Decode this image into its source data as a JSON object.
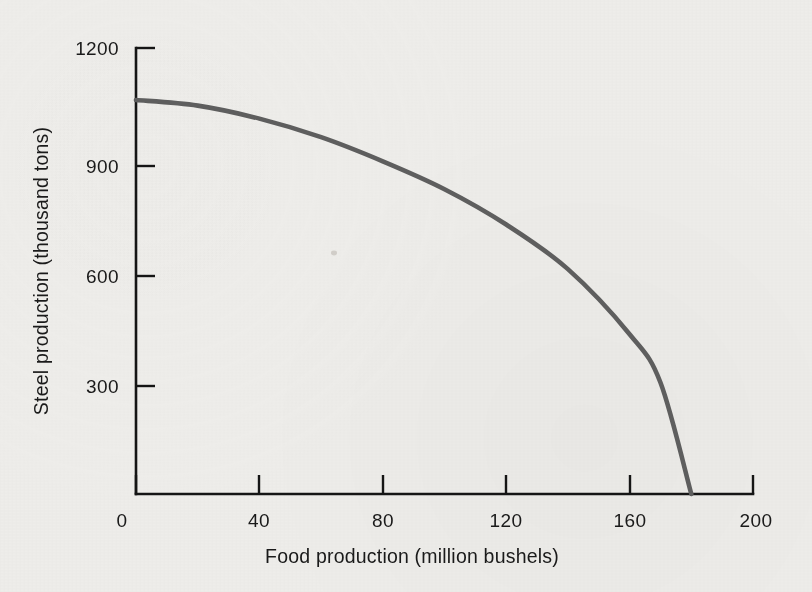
{
  "chart_data": {
    "type": "line",
    "title": "",
    "subtitle": "",
    "xlabel": "Food production (million bushels)",
    "ylabel": "Steel production (thousand tons)",
    "xlim": [
      0,
      200
    ],
    "ylim": [
      0,
      1200
    ],
    "xticks": [
      0,
      40,
      80,
      120,
      160,
      200
    ],
    "yticks": [
      300,
      600,
      900,
      1200
    ],
    "xtick_labels": [
      "0",
      "40",
      "80",
      "120",
      "160",
      "200"
    ],
    "ytick_labels": [
      "300",
      "600",
      "900",
      "1200"
    ],
    "grid": false,
    "legend": null,
    "annotations": [],
    "series": [
      {
        "name": "Production possibilities frontier",
        "color": "#5e5e5e",
        "style": "solid",
        "x": [
          0,
          20,
          40,
          60,
          80,
          100,
          120,
          140,
          160,
          170,
          180
        ],
        "y": [
          1060,
          1045,
          1010,
          960,
          895,
          820,
          725,
          605,
          430,
          300,
          0
        ],
        "points": [
          {
            "x": 0,
            "y": 1060
          },
          {
            "x": 20,
            "y": 1045
          },
          {
            "x": 40,
            "y": 1010
          },
          {
            "x": 60,
            "y": 960
          },
          {
            "x": 80,
            "y": 895
          },
          {
            "x": 100,
            "y": 820
          },
          {
            "x": 120,
            "y": 725
          },
          {
            "x": 140,
            "y": 605
          },
          {
            "x": 160,
            "y": 430
          },
          {
            "x": 170,
            "y": 300
          },
          {
            "x": 180,
            "y": 0
          }
        ]
      }
    ]
  },
  "axes": {
    "y_axis_name": "steel-production-axis",
    "x_axis_name": "food-production-axis"
  },
  "colors": {
    "background": "#eeedea",
    "axis": "#151515",
    "curve": "#5e5e5e",
    "text": "#1a1a1a"
  }
}
